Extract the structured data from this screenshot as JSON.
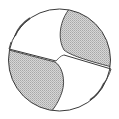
{
  "diagram": {
    "colors": {
      "background": "#ffffff",
      "outline": "#3a3a3a",
      "shade": "#c8c8c8",
      "face": "#ffffff"
    },
    "regions": [
      {
        "name": "flute-upper-right",
        "fill": "shaded"
      },
      {
        "name": "flute-lower-left",
        "fill": "shaded"
      },
      {
        "name": "cutting-face-upper-left",
        "fill": "white"
      },
      {
        "name": "cutting-face-lower-right",
        "fill": "white"
      }
    ],
    "labels": []
  }
}
